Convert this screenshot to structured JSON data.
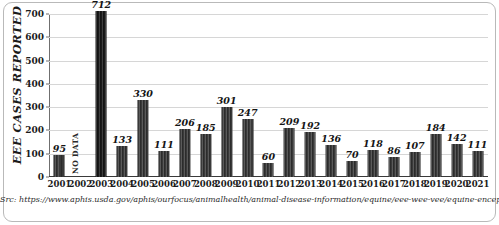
{
  "chart_data": {
    "type": "bar",
    "title": "",
    "xlabel": "",
    "ylabel": "EEE CASES REPORTED",
    "ylim": [
      0,
      700
    ],
    "ytick_labels": [
      "700",
      "600",
      "500",
      "400",
      "300",
      "200",
      "100",
      "0"
    ],
    "ytick_values": [
      700,
      600,
      500,
      400,
      300,
      200,
      100,
      0
    ],
    "grid": true,
    "legend": "none",
    "categories": [
      "2001",
      "2002",
      "2003",
      "2004",
      "2005",
      "2006",
      "2007",
      "2008",
      "2009",
      "2010",
      "2011",
      "2012",
      "2013",
      "2014",
      "2015",
      "2016",
      "2017",
      "2018",
      "2019",
      "2020",
      "2021"
    ],
    "values": [
      95,
      null,
      712,
      133,
      330,
      111,
      206,
      185,
      301,
      247,
      60,
      209,
      192,
      136,
      70,
      118,
      86,
      107,
      184,
      142,
      111
    ],
    "data_labels": [
      "95",
      "",
      "712",
      "133",
      "330",
      "111",
      "206",
      "185",
      "301",
      "247",
      "60",
      "209",
      "192",
      "136",
      "70",
      "118",
      "86",
      "107",
      "184",
      "142",
      "111"
    ],
    "annotations": [
      {
        "category": "2002",
        "text": "NO DATA"
      }
    ],
    "bar_color": "#3a3a3a",
    "grid_color": "#d6d6d6",
    "axis_color": "#3a3a3a"
  },
  "source": {
    "text": "Src: https://www.aphis.usda.gov/aphis/ourfocus/animalhealth/animal-disease-information/equine/eee-wee-vee/equine-encephalitis (8/2023)"
  }
}
